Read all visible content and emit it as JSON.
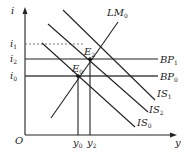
{
  "diagram": {
    "axes": {
      "y_label": "i",
      "x_label": "y",
      "origin_label": "O"
    },
    "curves": [
      {
        "id": "LM0",
        "label": "LM",
        "sub": "0"
      },
      {
        "id": "BP1",
        "label": "BP",
        "sub": "1"
      },
      {
        "id": "BP0",
        "label": "BP",
        "sub": "0"
      },
      {
        "id": "IS1",
        "label": "IS",
        "sub": "1"
      },
      {
        "id": "IS2",
        "label": "IS",
        "sub": "2"
      },
      {
        "id": "IS0",
        "label": "IS",
        "sub": "0"
      }
    ],
    "points": [
      {
        "id": "E2",
        "label": "E",
        "sub": "2"
      },
      {
        "id": "E0",
        "label": "E",
        "sub": "0"
      }
    ],
    "y_ticks": [
      {
        "label": "i",
        "sub": "1"
      },
      {
        "label": "i",
        "sub": "2"
      },
      {
        "label": "i",
        "sub": "0"
      }
    ],
    "x_ticks": [
      {
        "label": "y",
        "sub": "0"
      },
      {
        "label": "y",
        "sub": "2"
      }
    ]
  }
}
